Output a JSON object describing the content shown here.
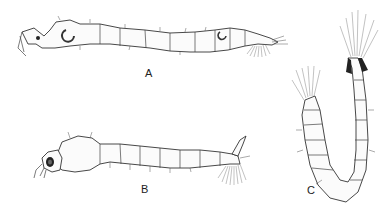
{
  "figure": {
    "background": "#ffffff",
    "ink_color": "#333333",
    "specimens": [
      {
        "id": "A",
        "label": "A",
        "view": "lateral, elongate larva with curved respiratory horns and terminal brush",
        "label_pos": [
          149,
          75
        ]
      },
      {
        "id": "B",
        "label": "B",
        "view": "lateral, larva with enlarged thorax, large eye, siphon and fan brush",
        "label_pos": [
          145,
          191
        ]
      },
      {
        "id": "C",
        "label": "C",
        "view": "dorsal, U-shaped curled larva with long setae tufts at both ends",
        "label_pos": [
          311,
          192
        ]
      }
    ]
  }
}
